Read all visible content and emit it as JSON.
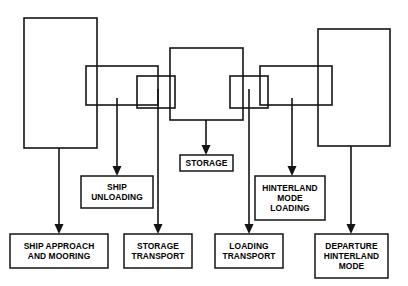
{
  "diagram": {
    "stroke_color": "#141414",
    "background_color": "#ffffff",
    "phases": [
      {
        "name": "ship-approach-phase",
        "x": 24,
        "y": 18,
        "width": 73,
        "height": 130
      },
      {
        "name": "ship-unloading-phase",
        "x": 86,
        "y": 66,
        "width": 72,
        "height": 39
      },
      {
        "name": "storage-transport-phase",
        "x": 137,
        "y": 76,
        "width": 38,
        "height": 32
      },
      {
        "name": "storage-phase",
        "x": 170,
        "y": 48,
        "width": 73,
        "height": 72
      },
      {
        "name": "loading-transport-phase",
        "x": 230,
        "y": 76,
        "width": 38,
        "height": 32
      },
      {
        "name": "hinterland-loading-phase",
        "x": 260,
        "y": 66,
        "width": 72,
        "height": 39
      },
      {
        "name": "departure-phase",
        "x": 318,
        "y": 29,
        "width": 72,
        "height": 117
      }
    ],
    "connectors": [
      {
        "name": "connector-ship-approach-and-mooring",
        "x": 59,
        "y_start": 148,
        "y_end": 234
      },
      {
        "name": "connector-ship-unloading",
        "x": 117,
        "y_start": 98,
        "y_end": 176
      },
      {
        "name": "connector-storage-transport",
        "x": 158,
        "y_start": 89,
        "y_end": 234
      },
      {
        "name": "connector-storage",
        "x": 206,
        "y_start": 120,
        "y_end": 155
      },
      {
        "name": "connector-loading-transport",
        "x": 249,
        "y_start": 89,
        "y_end": 234
      },
      {
        "name": "connector-hinterland-mode-loading",
        "x": 292,
        "y_start": 98,
        "y_end": 176
      },
      {
        "name": "connector-departure-hinterland-mode",
        "x": 351,
        "y_start": 146,
        "y_end": 234
      }
    ],
    "labels": [
      {
        "id": "ship-approach-and-mooring",
        "text": "SHIP APPROACH\nAND MOORING",
        "x": 10,
        "y": 234,
        "width": 98,
        "height": 34
      },
      {
        "id": "ship-unloading",
        "text": "SHIP\nUNLOADING",
        "x": 81,
        "y": 176,
        "width": 72,
        "height": 32
      },
      {
        "id": "storage-transport",
        "text": "STORAGE\nTRANSPORT",
        "x": 124,
        "y": 234,
        "width": 68,
        "height": 34
      },
      {
        "id": "storage",
        "text": "STORAGE",
        "x": 180,
        "y": 155,
        "width": 53,
        "height": 16
      },
      {
        "id": "loading-transport",
        "text": "LOADING\nTRANSPORT",
        "x": 215,
        "y": 234,
        "width": 68,
        "height": 34
      },
      {
        "id": "hinterland-mode-loading",
        "text": "HINTERLAND\nMODE\nLOADING",
        "x": 255,
        "y": 176,
        "width": 70,
        "height": 44
      },
      {
        "id": "departure-hinterland-mode",
        "text": "DEPARTURE\nHINTERLAND\nMODE",
        "x": 315,
        "y": 234,
        "width": 73,
        "height": 44
      }
    ]
  }
}
